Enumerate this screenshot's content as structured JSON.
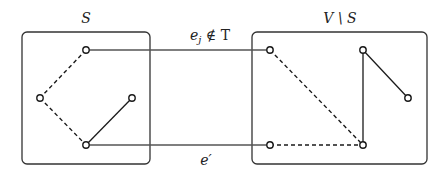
{
  "diagram": {
    "labels": {
      "left_set": "S",
      "right_set": "V \\ S",
      "top_edge": "e",
      "top_edge_sub": "j",
      "top_edge_rel": " ∉ T",
      "bottom_edge": "e′"
    },
    "colors": {
      "stroke": "#1a1a1a",
      "box": "#333333",
      "background": "#ffffff"
    },
    "sets": [
      {
        "name": "S",
        "x": 22,
        "y": 32,
        "w": 128,
        "h": 132
      },
      {
        "name": "V \\ S",
        "x": 252,
        "y": 32,
        "w": 175,
        "h": 132
      }
    ],
    "nodes": [
      {
        "id": "s1",
        "x": 86,
        "y": 50
      },
      {
        "id": "s2",
        "x": 40,
        "y": 98
      },
      {
        "id": "s3",
        "x": 132,
        "y": 98
      },
      {
        "id": "s4",
        "x": 86,
        "y": 145
      },
      {
        "id": "v1",
        "x": 270,
        "y": 50
      },
      {
        "id": "v2",
        "x": 363,
        "y": 50
      },
      {
        "id": "v3",
        "x": 408,
        "y": 98
      },
      {
        "id": "v4",
        "x": 270,
        "y": 145
      },
      {
        "id": "v5",
        "x": 363,
        "y": 145
      }
    ],
    "edges": [
      {
        "from": "s1",
        "to": "s2",
        "style": "dashed"
      },
      {
        "from": "s2",
        "to": "s4",
        "style": "dashed"
      },
      {
        "from": "s4",
        "to": "s3",
        "style": "solid"
      },
      {
        "from": "s1",
        "to": "v1",
        "style": "solid",
        "label": "e_j ∉ T"
      },
      {
        "from": "s4",
        "to": "v4",
        "style": "solid",
        "label": "e′"
      },
      {
        "from": "v1",
        "to": "v5",
        "style": "dashed"
      },
      {
        "from": "v4",
        "to": "v5",
        "style": "dashed"
      },
      {
        "from": "v5",
        "to": "v2",
        "style": "solid"
      },
      {
        "from": "v2",
        "to": "v3",
        "style": "solid"
      }
    ]
  }
}
